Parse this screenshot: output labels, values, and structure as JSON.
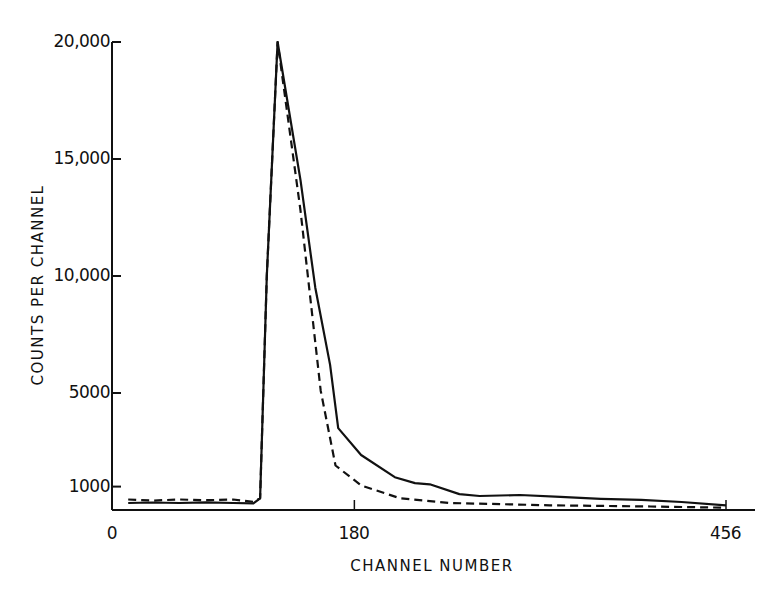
{
  "chart_data": {
    "type": "line",
    "title": "",
    "xlabel": "CHANNEL NUMBER",
    "ylabel": "COUNTS PER CHANNEL",
    "xlim": [
      0,
      456
    ],
    "ylim": [
      0,
      20000
    ],
    "x_ticks": [
      {
        "value": 0,
        "label": "0"
      },
      {
        "value": 180,
        "label": "180"
      },
      {
        "value": 456,
        "label": "456"
      }
    ],
    "y_ticks": [
      {
        "value": 1000,
        "label": "1000"
      },
      {
        "value": 5000,
        "label": "5000"
      },
      {
        "value": 10000,
        "label": "10,000"
      },
      {
        "value": 15000,
        "label": "15,000"
      },
      {
        "value": 20000,
        "label": "20,000"
      }
    ],
    "grid": false,
    "legend": null,
    "series": [
      {
        "name": "solid",
        "style": "solid",
        "x": [
          12,
          30,
          50,
          70,
          90,
          105,
          110,
          115,
          123,
          140,
          151,
          162,
          168,
          185,
          210,
          225,
          236,
          258,
          273,
          303,
          333,
          363,
          393,
          423,
          456
        ],
        "y": [
          300,
          320,
          300,
          330,
          300,
          280,
          500,
          10000,
          20000,
          14100,
          9500,
          6200,
          3500,
          2350,
          1400,
          1150,
          1100,
          680,
          600,
          640,
          560,
          480,
          430,
          340,
          200
        ]
      },
      {
        "name": "dashed",
        "style": "dashed",
        "x": [
          12,
          30,
          50,
          70,
          90,
          105,
          110,
          115,
          123,
          140,
          155,
          166,
          185,
          214,
          251,
          325,
          400,
          456
        ],
        "y": [
          450,
          400,
          450,
          420,
          450,
          350,
          500,
          10000,
          20000,
          12800,
          5100,
          1900,
          1050,
          500,
          300,
          200,
          150,
          100
        ]
      }
    ]
  }
}
